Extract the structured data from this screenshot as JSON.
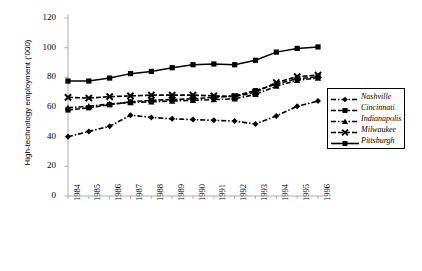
{
  "chart_data": {
    "type": "line",
    "title": "",
    "xlabel": "",
    "ylabel": "High-technology employment ('000)",
    "categories": [
      "1984",
      "1985",
      "1986",
      "1987",
      "1988",
      "1989",
      "1990",
      "1991",
      "1992",
      "1993",
      "1994",
      "1995",
      "1996"
    ],
    "ylim": [
      0,
      120
    ],
    "yticks": [
      0,
      20,
      40,
      60,
      80,
      100,
      120
    ],
    "grid": false,
    "legend_position": "right",
    "series": [
      {
        "name": "Nashville",
        "marker": "diamond",
        "line": "dash-dot",
        "values": [
          40.0,
          43.5,
          47.0,
          54.5,
          53.0,
          52.0,
          51.5,
          51.0,
          50.5,
          48.5,
          54.0,
          60.5,
          64.0
        ]
      },
      {
        "name": "Cincinnati",
        "marker": "square",
        "line": "dashed",
        "values": [
          58.0,
          59.5,
          61.5,
          63.5,
          64.5,
          65.0,
          65.5,
          66.5,
          67.5,
          71.0,
          75.5,
          79.0,
          80.5
        ]
      },
      {
        "name": "Indianapolis",
        "marker": "triangle",
        "line": "dash-dot",
        "values": [
          59.5,
          60.5,
          62.0,
          63.0,
          63.5,
          64.0,
          64.5,
          65.0,
          65.5,
          68.5,
          74.0,
          78.0,
          79.5
        ]
      },
      {
        "name": "Milwaukee",
        "marker": "cross",
        "line": "dashed",
        "values": [
          66.5,
          66.0,
          67.0,
          67.5,
          68.0,
          68.0,
          68.0,
          67.5,
          67.0,
          70.0,
          76.5,
          80.5,
          81.5
        ]
      },
      {
        "name": "Pittsburgh",
        "marker": "square-filled",
        "line": "solid",
        "values": [
          77.5,
          77.5,
          79.5,
          82.5,
          84.0,
          86.5,
          88.5,
          89.0,
          88.5,
          91.5,
          97.0,
          99.5,
          100.5
        ]
      }
    ]
  },
  "legend": {
    "items": [
      {
        "label": "Nashville"
      },
      {
        "label": "Cincinnati"
      },
      {
        "label": "Indianapolis"
      },
      {
        "label": "Milwaukee"
      },
      {
        "label": "Pittsburgh"
      }
    ]
  }
}
